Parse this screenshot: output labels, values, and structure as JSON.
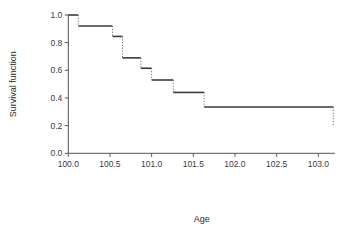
{
  "chart_data": {
    "type": "line",
    "title": "",
    "subtitle": "",
    "xlabel": "Age",
    "ylabel": "Survival function",
    "xlim": [
      99.85,
      103.25
    ],
    "ylim": [
      -0.03,
      1.03
    ],
    "xticks": [
      100.0,
      100.5,
      101.0,
      101.5,
      102.0,
      102.5,
      103.0
    ],
    "xticklabels": [
      "100.0",
      "100.5",
      "101.0",
      "101.5",
      "102.0",
      "102.5",
      "103.0"
    ],
    "yticks": [
      0.0,
      0.2,
      0.4,
      0.6,
      0.8,
      1.0
    ],
    "yticklabels": [
      "0.0",
      "0.2",
      "0.4",
      "0.6",
      "0.8",
      "1.0"
    ],
    "grid": false,
    "legend": null,
    "style": "kaplan-meier step function, solid horizontal segments with dotted vertical drops",
    "series": [
      {
        "name": "Survival function",
        "x": [
          100.0,
          100.12,
          100.53,
          100.65,
          100.87,
          101.0,
          101.26,
          101.63,
          103.18
        ],
        "values": [
          1.0,
          0.92,
          0.845,
          0.69,
          0.615,
          0.53,
          0.44,
          0.335,
          0.2
        ],
        "steps": [
          {
            "x_start": 100.0,
            "x_end": 100.12,
            "y": 1.0,
            "drop_to": 0.92
          },
          {
            "x_start": 100.12,
            "x_end": 100.53,
            "y": 0.92,
            "drop_to": 0.845
          },
          {
            "x_start": 100.53,
            "x_end": 100.65,
            "y": 0.845,
            "drop_to": 0.69
          },
          {
            "x_start": 100.65,
            "x_end": 100.87,
            "y": 0.69,
            "drop_to": 0.615
          },
          {
            "x_start": 100.87,
            "x_end": 101.0,
            "y": 0.615,
            "drop_to": 0.53
          },
          {
            "x_start": 101.0,
            "x_end": 101.26,
            "y": 0.53,
            "drop_to": 0.44
          },
          {
            "x_start": 101.26,
            "x_end": 101.63,
            "y": 0.44,
            "drop_to": 0.335
          },
          {
            "x_start": 101.63,
            "x_end": 103.18,
            "y": 0.335,
            "drop_to": 0.2
          }
        ]
      }
    ],
    "colors": {
      "line": "#3b3b3b",
      "drop": "#6e6e6e",
      "axis": "#555555",
      "background": "#ffffff"
    }
  }
}
